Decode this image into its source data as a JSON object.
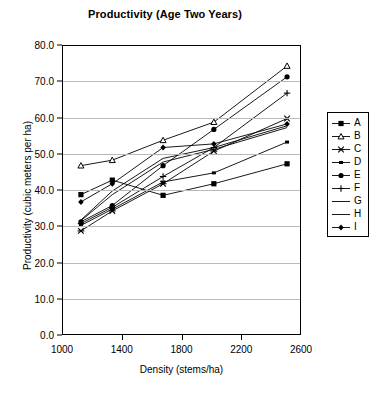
{
  "chart_data": {
    "type": "line",
    "title": "Productivity (Age Two Years)",
    "xlabel": "Density (stems/ha)",
    "ylabel": "Productivity (cubic meters per ha)",
    "xlim": [
      1000,
      2600
    ],
    "ylim": [
      0.0,
      80.0
    ],
    "xticks": [
      1000,
      1400,
      1800,
      2200,
      2600
    ],
    "xtick_labels": [
      "1000",
      "1400",
      "1800",
      "2200",
      "2600"
    ],
    "yticks": [
      0.0,
      10.0,
      20.0,
      30.0,
      40.0,
      50.0,
      60.0,
      70.0,
      80.0
    ],
    "ytick_labels": [
      "0.0",
      "10.0",
      "20.0",
      "30.0",
      "40.0",
      "50.0",
      "60.0",
      "70.0",
      "80.0"
    ],
    "grid": "horizontal",
    "legend_position": "right",
    "x": [
      1120,
      1330,
      1670,
      2010,
      2500
    ],
    "series": [
      {
        "name": "A",
        "marker": "filled-square",
        "values": [
          39.0,
          43.0,
          38.8,
          42.0,
          47.5
        ]
      },
      {
        "name": "B",
        "marker": "open-triangle",
        "values": [
          47.0,
          48.5,
          54.0,
          59.0,
          74.5
        ]
      },
      {
        "name": "C",
        "marker": "cross-x",
        "values": [
          29.0,
          34.5,
          42.0,
          51.0,
          60.0
        ]
      },
      {
        "name": "D",
        "marker": "small-square",
        "values": [
          30.5,
          35.0,
          42.5,
          45.0,
          53.5
        ]
      },
      {
        "name": "E",
        "marker": "filled-circle",
        "values": [
          31.5,
          36.0,
          47.0,
          57.0,
          71.5
        ]
      },
      {
        "name": "F",
        "marker": "plus",
        "values": [
          31.0,
          35.5,
          44.0,
          52.0,
          67.0
        ]
      },
      {
        "name": "G",
        "marker": "line",
        "values": [
          32.0,
          40.0,
          49.0,
          52.0,
          58.0
        ]
      },
      {
        "name": "H",
        "marker": "line",
        "values": [
          31.8,
          39.0,
          48.0,
          51.5,
          57.5
        ]
      },
      {
        "name": "I",
        "marker": "filled-diamond",
        "values": [
          37.0,
          42.0,
          52.0,
          53.0,
          58.5
        ]
      }
    ]
  },
  "legend": {
    "items": [
      {
        "label": "A"
      },
      {
        "label": "B"
      },
      {
        "label": "C"
      },
      {
        "label": "D"
      },
      {
        "label": "E"
      },
      {
        "label": "F"
      },
      {
        "label": "G"
      },
      {
        "label": "H"
      },
      {
        "label": "I"
      }
    ]
  },
  "colors": {
    "line": "#000000",
    "grid": "#b9b9b9",
    "background": "#ffffff"
  }
}
